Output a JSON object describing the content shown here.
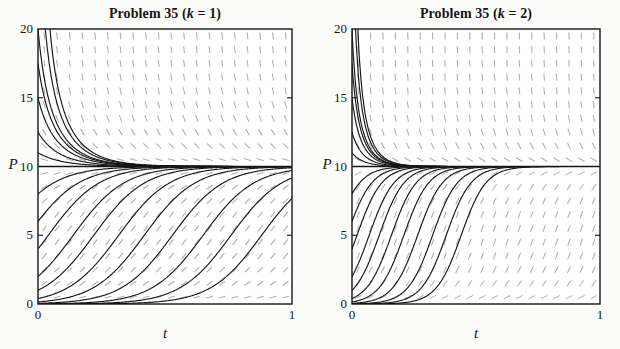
{
  "page": {
    "background": "#fbfbfa",
    "ink": "#161616",
    "slope_field_color": "#b0b0b0",
    "plot_area_color": "#ffffff"
  },
  "chart_data": [
    {
      "type": "line",
      "title": "Problem 35 (k = 1)",
      "title_prefix": "Problem 35 (",
      "title_k": "k",
      "title_suffix": " = 1)",
      "k": 1,
      "model": "slope field and solution curves of dP/dt = kP(10 - P)",
      "xlabel": "t",
      "ylabel": "P",
      "xlim": [
        0,
        1
      ],
      "ylim": [
        0,
        20
      ],
      "xticks": [
        0,
        1
      ],
      "yticks": [
        0,
        5,
        10,
        15,
        20
      ],
      "equilibrium": 10,
      "initial_values": [
        50,
        30,
        20,
        17.5,
        15,
        12.5,
        11,
        8,
        6,
        4,
        2,
        1,
        0.4,
        0.15,
        0.05,
        0.015,
        0.005,
        0.0015
      ],
      "slope_field": {
        "cols": 20,
        "rows": 20
      }
    },
    {
      "type": "line",
      "title": "Problem 35 (k = 2)",
      "title_prefix": "Problem 35 (",
      "title_k": "k",
      "title_suffix": " = 2)",
      "k": 2,
      "model": "slope field and solution curves of dP/dt = kP(10 - P)",
      "xlabel": "t",
      "ylabel": "P",
      "xlim": [
        0,
        1
      ],
      "ylim": [
        0,
        20
      ],
      "xticks": [
        0,
        1
      ],
      "yticks": [
        0,
        5,
        10,
        15,
        20
      ],
      "equilibrium": 10,
      "initial_values": [
        50,
        30,
        20,
        17.5,
        15,
        12.5,
        11,
        8,
        6,
        4,
        2,
        1,
        0.4,
        0.15,
        0.05,
        0.015,
        0.005,
        0.0015
      ],
      "slope_field": {
        "cols": 20,
        "rows": 20
      }
    }
  ]
}
